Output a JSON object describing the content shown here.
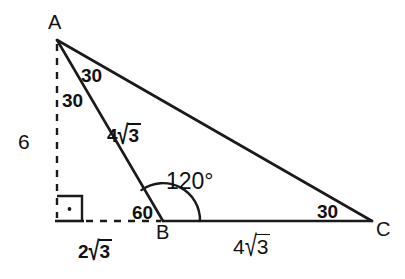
{
  "figure": {
    "background_color": "#ffffff",
    "stroke_color": "#1a1a1a"
  },
  "vertices": {
    "a": {
      "label": "A",
      "x": 57,
      "y": 40
    },
    "b": {
      "label": "B",
      "x": 163,
      "y": 221
    },
    "c": {
      "label": "C",
      "x": 372,
      "y": 221
    },
    "foot": {
      "label": "",
      "x": 57,
      "y": 221
    }
  },
  "angles": {
    "at_a_upper": {
      "value": "30",
      "unit": ""
    },
    "at_a_lower": {
      "value": "30",
      "unit": ""
    },
    "at_b_exterior": {
      "value": "60",
      "unit": ""
    },
    "at_b_interior": {
      "value": "120",
      "unit": "°",
      "display": "120°"
    },
    "at_c": {
      "value": "30",
      "unit": ""
    }
  },
  "lengths": {
    "altitude": {
      "coefficient": "6",
      "radicand": "",
      "display": "6"
    },
    "side_ab": {
      "coefficient": "4",
      "radicand": "3",
      "display": "4√3"
    },
    "side_bc": {
      "coefficient": "4",
      "radicand": "3",
      "display": "4√3"
    },
    "foot_to_b": {
      "coefficient": "2",
      "radicand": "3",
      "display": "2√3"
    }
  },
  "marks": {
    "right_angle": {
      "name": "right-angle-square",
      "size": 25
    },
    "angle_arc": {
      "name": "angle-arc-120",
      "radius": 37
    }
  },
  "symbols": {
    "radical_sign": "√",
    "degree_sign": "°"
  }
}
